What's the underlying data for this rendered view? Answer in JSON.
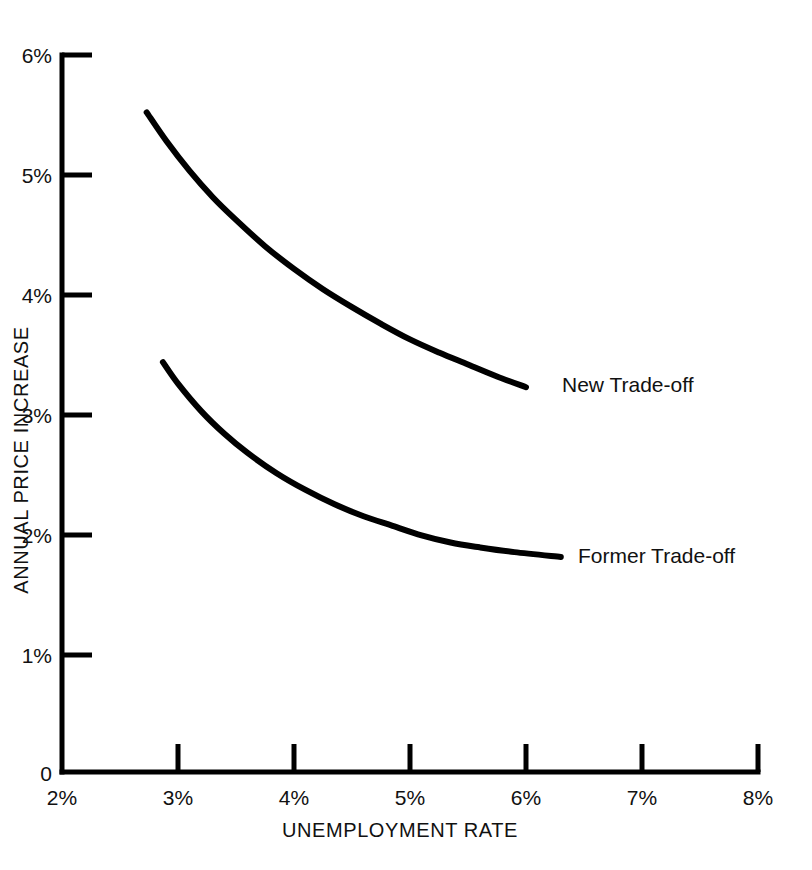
{
  "chart_data": {
    "type": "line",
    "title": "",
    "subtitle": "",
    "xlabel": "UNEMPLOYMENT RATE",
    "ylabel": "ANNUAL PRICE INCREASE",
    "xlim": [
      2,
      8
    ],
    "ylim": [
      0,
      6
    ],
    "xticks": [
      2,
      3,
      4,
      5,
      6,
      7,
      8
    ],
    "xtick_labels": [
      "2%",
      "3%",
      "4%",
      "5%",
      "6%",
      "7%",
      "8%"
    ],
    "yticks": [
      0,
      1,
      2,
      3,
      4,
      5,
      6
    ],
    "ytick_labels": [
      "0",
      "1%",
      "2%",
      "3%",
      "4%",
      "5%",
      "6%"
    ],
    "grid": false,
    "legend_position": "inline-right-of-curve-ends",
    "line_color": "#000000",
    "line_width_px": 6,
    "series": [
      {
        "name": "New  Trade-off",
        "label_x": 6.15,
        "label_y": 3.17,
        "x": [
          2.73,
          2.9,
          3.1,
          3.3,
          3.5,
          3.75,
          4.0,
          4.25,
          4.5,
          4.75,
          5.0,
          5.25,
          5.5,
          5.75,
          6.0
        ],
        "y": [
          5.52,
          5.28,
          5.03,
          4.81,
          4.62,
          4.4,
          4.21,
          4.04,
          3.89,
          3.75,
          3.62,
          3.51,
          3.41,
          3.31,
          3.22
        ]
      },
      {
        "name": "Former  Trade-off",
        "label_x": 6.45,
        "label_y": 1.76,
        "x": [
          2.87,
          3.0,
          3.2,
          3.4,
          3.6,
          3.85,
          4.1,
          4.35,
          4.6,
          4.85,
          5.1,
          5.35,
          5.6,
          5.9,
          6.3
        ],
        "y": [
          3.43,
          3.25,
          3.02,
          2.83,
          2.67,
          2.5,
          2.36,
          2.24,
          2.14,
          2.06,
          1.98,
          1.92,
          1.88,
          1.84,
          1.8
        ]
      }
    ]
  },
  "axes": {
    "y_axis_title": "ANNUAL PRICE INCREASE",
    "x_axis_title": "UNEMPLOYMENT RATE",
    "y_tick_0": "0",
    "y_tick_1": "1%",
    "y_tick_2": "2%",
    "y_tick_3": "3%",
    "y_tick_4": "4%",
    "y_tick_5": "5%",
    "y_tick_6": "6%",
    "x_tick_2": "2%",
    "x_tick_3": "3%",
    "x_tick_4": "4%",
    "x_tick_5": "5%",
    "x_tick_6": "6%",
    "x_tick_7": "7%",
    "x_tick_8": "8%"
  },
  "labels": {
    "new_tradeoff": "New  Trade-off",
    "former_tradeoff": "Former  Trade-off"
  }
}
